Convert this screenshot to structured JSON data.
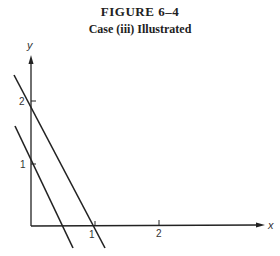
{
  "figure": {
    "label": "FIGURE 6–4",
    "caption": "Case (iii) Illustrated"
  },
  "axes": {
    "x_label": "x",
    "y_label": "y",
    "x_ticks": [
      "1",
      "2"
    ],
    "y_ticks": [
      "1",
      "2"
    ]
  },
  "lines": [
    {
      "name": "line-intercept-1",
      "y_intercept": 1,
      "x_intercept": 0.5
    },
    {
      "name": "line-intercept-2",
      "y_intercept": 2,
      "x_intercept": 1
    }
  ],
  "colors": {
    "ink": "#222222",
    "background": "#ffffff"
  }
}
